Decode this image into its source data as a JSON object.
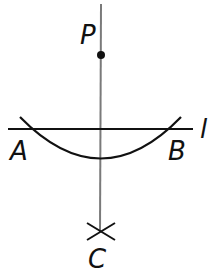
{
  "diagram": {
    "labels": {
      "P": "P",
      "A": "A",
      "B": "B",
      "C": "C",
      "l": "l"
    },
    "colors": {
      "ink": "#111111",
      "perpendicular": "#777777",
      "background": "#ffffff"
    }
  }
}
